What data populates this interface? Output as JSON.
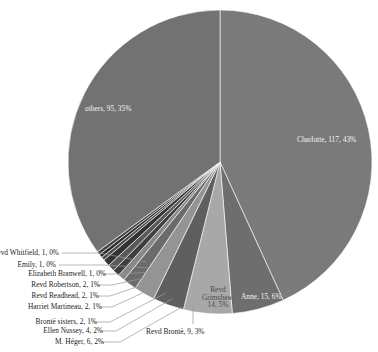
{
  "chart_data": {
    "type": "pie",
    "title": "",
    "total": 272,
    "legend_position": "none",
    "grid": false,
    "categories": [
      "Charlotte",
      "Anne",
      "Revd Grimshaw",
      "Revd Brontë",
      "M. Héger",
      "Ellen Nussey",
      "Brontë sisters",
      "Harriet Martineau",
      "Revd Readhead",
      "Revd Robertson",
      "Elizabeth Branwell",
      "Emily",
      "Revd Whitfield",
      "others"
    ],
    "values": [
      117,
      15,
      14,
      9,
      6,
      4,
      2,
      2,
      2,
      2,
      1,
      1,
      1,
      95
    ],
    "percents": [
      "43%",
      "6%",
      "5%",
      "3%",
      "2%",
      "2%",
      "1%",
      "1%",
      "1%",
      "1%",
      "0%",
      "0%",
      "0%",
      "35%"
    ],
    "slices": [
      {
        "name": "Charlotte",
        "value": 117,
        "percent": "43%",
        "label": "Charlotte, 117, 43%",
        "color": "#7a7a7a",
        "label_placement": "inside"
      },
      {
        "name": "Anne",
        "value": 15,
        "percent": "6%",
        "label": "Anne, 15, 6%",
        "color": "#6e6e6e",
        "label_placement": "inside"
      },
      {
        "name": "Revd Grimshaw",
        "value": 14,
        "percent": "5%",
        "label": "Revd Grimshaw, 14, 5%",
        "label_line1": "Revd",
        "label_line2": "Grimshaw,",
        "label_line3": "14, 5%",
        "color": "#a8a8a8",
        "label_placement": "inside"
      },
      {
        "name": "Revd Brontë",
        "value": 9,
        "percent": "3%",
        "label": "Revd Brontë, 9, 3%",
        "color": "#5f5f5f",
        "label_placement": "outside"
      },
      {
        "name": "M. Héger",
        "value": 6,
        "percent": "2%",
        "label": "M. Héger, 6, 2%",
        "color": "#949494",
        "label_placement": "outside"
      },
      {
        "name": "Ellen Nussey",
        "value": 4,
        "percent": "2%",
        "label": "Ellen Nussey, 4, 2%",
        "color": "#6b6b6b",
        "label_placement": "outside"
      },
      {
        "name": "Brontë sisters",
        "value": 2,
        "percent": "1%",
        "label": "Brontë sisters, 2, 1%",
        "color": "#888888",
        "label_placement": "outside"
      },
      {
        "name": "Harriet Martineau",
        "value": 2,
        "percent": "1%",
        "label": "Harriet Martineau, 2, 1%",
        "color": "#3f3f3f",
        "label_placement": "outside"
      },
      {
        "name": "Revd Readhead",
        "value": 2,
        "percent": "1%",
        "label": "Revd Readhead, 2, 1%",
        "color": "#5a5a5a",
        "label_placement": "outside"
      },
      {
        "name": "Revd Robertson",
        "value": 2,
        "percent": "1%",
        "label": "Revd Robertson, 2, 1%",
        "color": "#333333",
        "label_placement": "outside"
      },
      {
        "name": "Elizabeth Branwell",
        "value": 1,
        "percent": "0%",
        "label": "Elizabeth Branwell, 1, 0%",
        "color": "#4d4d4d",
        "label_placement": "outside"
      },
      {
        "name": "Emily",
        "value": 1,
        "percent": "0%",
        "label": "Emily, 1, 0%",
        "color": "#2b2b2b",
        "label_placement": "outside"
      },
      {
        "name": "Revd Whitfield",
        "value": 1,
        "percent": "0%",
        "label": "Revd Whitfield, 1, 0%",
        "color": "#444444",
        "label_placement": "outside"
      },
      {
        "name": "others",
        "value": 95,
        "percent": "35%",
        "label": "others, 95, 35%",
        "color": "#727272",
        "label_placement": "inside"
      }
    ]
  }
}
